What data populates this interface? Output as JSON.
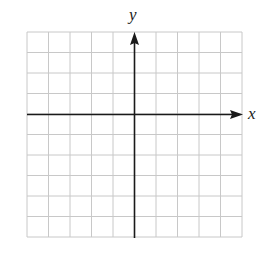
{
  "diagram": {
    "type": "coordinate-grid",
    "axes": {
      "x_label": "x",
      "y_label": "y"
    },
    "grid": {
      "columns": 10,
      "rows": 10,
      "origin_col": 5,
      "origin_row": 4
    },
    "colors": {
      "grid": "#c8c8c8",
      "axis": "#1a1a1a",
      "background": "#ffffff"
    }
  }
}
